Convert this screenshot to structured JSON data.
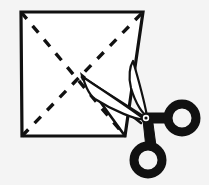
{
  "scene": {
    "title": "Folded paper square with cutting scissors",
    "background_color": "#f4f4f4",
    "ink_color": "#111111",
    "paper_color": "#ffffff",
    "canvas": {
      "width": 209,
      "height": 185
    }
  },
  "paper": {
    "label": "paper-square",
    "corners": {
      "top_left": [
        21,
        12
      ],
      "top_right": [
        143,
        12
      ],
      "bottom_right": [
        125,
        136
      ],
      "bottom_left": [
        22,
        136
      ]
    },
    "center": [
      82,
      77
    ]
  },
  "fold_lines": {
    "label": "dashed-fold-diagonals",
    "style": "dashed",
    "dash_pattern": "9 9",
    "diagonals": [
      {
        "name": "fold-main-diagonal",
        "from": [
          21,
          12
        ],
        "to": [
          125,
          136
        ]
      },
      {
        "name": "fold-anti-diagonal",
        "from": [
          22,
          136
        ],
        "to": [
          143,
          12
        ]
      }
    ]
  },
  "cut_lines": {
    "label": "solid-cut-lines",
    "style": "solid",
    "segments": [
      {
        "name": "cut-upper",
        "from": [
          82,
          77
        ],
        "to": [
          145,
          118
        ]
      },
      {
        "name": "cut-lower",
        "from": [
          82,
          77
        ],
        "to": [
          125,
          136
        ]
      },
      {
        "name": "cut-mid",
        "from": [
          82,
          77
        ],
        "to": [
          140,
          122
        ]
      }
    ]
  },
  "scissors": {
    "label": "scissors",
    "pivot": [
      146,
      118
    ],
    "upper_blade": {
      "tip": [
        132,
        62
      ],
      "base": [
        146,
        117
      ]
    },
    "lower_blade": {
      "tip": [
        83,
        78
      ],
      "base": [
        144,
        120
      ]
    },
    "rings": [
      {
        "name": "ring-upper-right",
        "center": [
          182,
          118
        ],
        "radius": 15
      },
      {
        "name": "ring-lower",
        "center": [
          148,
          160
        ],
        "radius": 15
      }
    ]
  }
}
